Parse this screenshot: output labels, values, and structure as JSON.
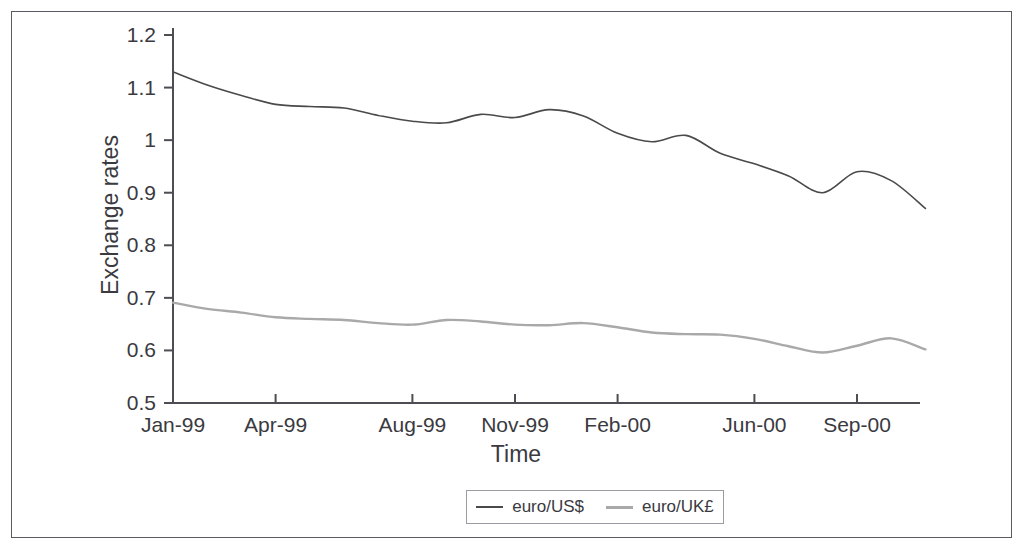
{
  "chart_data": {
    "type": "line",
    "title": "",
    "xlabel": "Time",
    "ylabel": "Exchange rates",
    "ylim": [
      0.5,
      1.2
    ],
    "yticks": [
      "0.5",
      "0.6",
      "0.7",
      "0.8",
      "0.9",
      "1",
      "1.1",
      "1.2"
    ],
    "ytick_values": [
      0.5,
      0.6,
      0.7,
      0.8,
      0.9,
      1.0,
      1.1,
      1.2
    ],
    "xticks": [
      "Jan-99",
      "Apr-99",
      "Aug-99",
      "Nov-99",
      "Feb-00",
      "Jun-00",
      "Sep-00"
    ],
    "xtick_values": [
      0,
      3,
      7,
      10,
      13,
      17,
      20
    ],
    "grid": false,
    "legend_position": "bottom-center",
    "x": [
      0,
      1,
      2,
      3,
      4,
      5,
      6,
      7,
      8,
      9,
      10,
      11,
      12,
      13,
      14,
      15,
      16,
      17,
      18,
      19,
      20,
      21,
      22
    ],
    "x_month_labels": [
      "Jan-99",
      "Feb-99",
      "Mar-99",
      "Apr-99",
      "May-99",
      "Jun-99",
      "Jul-99",
      "Aug-99",
      "Sep-99",
      "Oct-99",
      "Nov-99",
      "Dec-99",
      "Jan-00",
      "Feb-00",
      "Mar-00",
      "Apr-00",
      "May-00",
      "Jun-00",
      "Jul-00",
      "Aug-00",
      "Sep-00",
      "Oct-00",
      "Nov-00"
    ],
    "series": [
      {
        "name": "euro/US$",
        "color": "#4a4a4a",
        "values": [
          1.13,
          1.105,
          1.085,
          1.068,
          1.064,
          1.061,
          1.047,
          1.036,
          1.033,
          1.049,
          1.043,
          1.058,
          1.046,
          1.013,
          0.997,
          1.009,
          0.975,
          0.955,
          0.932,
          0.9,
          0.94,
          0.923,
          0.87
        ]
      },
      {
        "name": "euro/UK£",
        "color": "#a9a9a9",
        "values": [
          0.691,
          0.679,
          0.672,
          0.663,
          0.66,
          0.658,
          0.652,
          0.649,
          0.658,
          0.655,
          0.649,
          0.648,
          0.652,
          0.644,
          0.634,
          0.631,
          0.63,
          0.622,
          0.608,
          0.596,
          0.609,
          0.623,
          0.602
        ]
      }
    ]
  },
  "axes": {
    "y_title": "Exchange rates",
    "x_title": "Time"
  },
  "legend": {
    "entries": [
      {
        "label": "euro/US$",
        "swatch": "line-swatch-dark"
      },
      {
        "label": "euro/UK£",
        "swatch": "line-swatch-gray"
      }
    ]
  }
}
